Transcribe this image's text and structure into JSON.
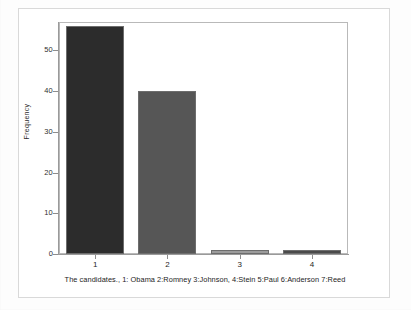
{
  "chart_data": {
    "type": "bar",
    "title": "",
    "subtitle": "",
    "xlabel": "The candidates., 1: Obama 2:Romney 3:Johnson, 4:Stein 5:Paul 6:Anderson 7:Reed",
    "ylabel": "Frequency",
    "categories": [
      "1",
      "2",
      "3",
      "4"
    ],
    "values": [
      56,
      40,
      1,
      1
    ],
    "series": [
      {
        "name": "Frequency",
        "values": [
          56,
          40,
          1,
          1
        ]
      }
    ],
    "bar_colors": [
      "#2c2c2c",
      "#565656",
      "#9c9c9c",
      "#4a4a4a"
    ],
    "ylim": [
      0,
      57
    ],
    "xlim": [
      0.5,
      4.5
    ],
    "y_ticks": [
      0,
      10,
      20,
      30,
      40,
      50
    ],
    "y_tick_labels": [
      "0",
      "10",
      "20",
      "30",
      "40",
      "50"
    ],
    "x_tick_labels": [
      "1",
      "2",
      "3",
      "4"
    ],
    "grid": false,
    "legend": false,
    "legend_position": "none",
    "background_color": "#ffffff",
    "axis_color": "#9a9a9a",
    "frame_color": "#d9d9d9"
  },
  "axes": {
    "y_title": "Frequency",
    "y_labels": [
      "50",
      "40",
      "30",
      "20",
      "10",
      "0"
    ],
    "x_labels": [
      "1",
      "2",
      "3",
      "4"
    ],
    "caption": "The candidates., 1: Obama 2:Romney 3:Johnson, 4:Stein 5:Paul 6:Anderson 7:Reed"
  }
}
